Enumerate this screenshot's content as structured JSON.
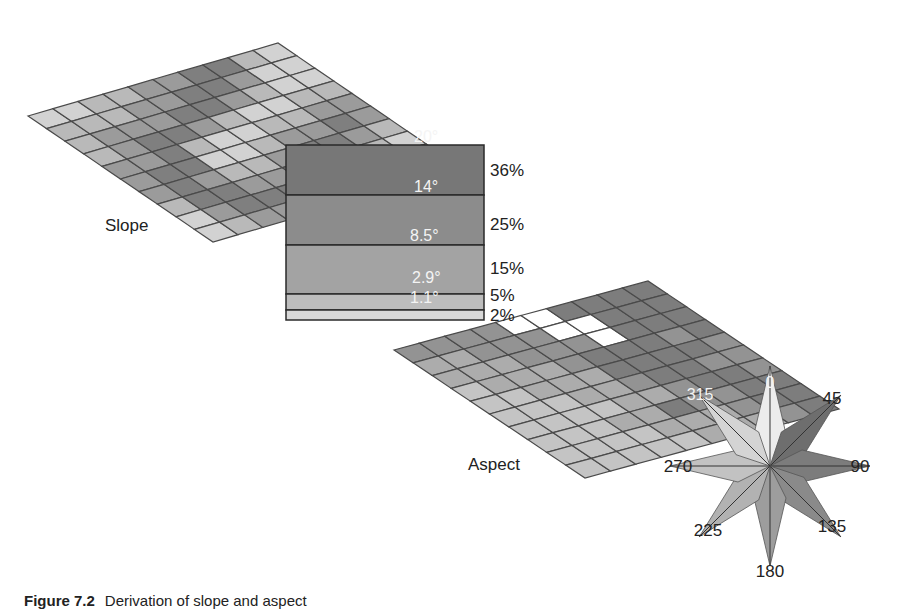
{
  "slope": {
    "label": "Slope",
    "grid_size": 10,
    "cells": [
      [
        4,
        4,
        3,
        3,
        2,
        2,
        1,
        1,
        3,
        4
      ],
      [
        3,
        3,
        3,
        2,
        2,
        1,
        1,
        2,
        4,
        4
      ],
      [
        3,
        2,
        2,
        2,
        1,
        1,
        2,
        3,
        4,
        4
      ],
      [
        3,
        2,
        1,
        1,
        2,
        3,
        4,
        4,
        3,
        3
      ],
      [
        2,
        2,
        1,
        3,
        4,
        4,
        3,
        3,
        2,
        2
      ],
      [
        2,
        1,
        1,
        4,
        4,
        3,
        2,
        2,
        1,
        2
      ],
      [
        2,
        1,
        2,
        3,
        3,
        2,
        1,
        1,
        2,
        3
      ],
      [
        3,
        1,
        1,
        2,
        2,
        1,
        1,
        2,
        3,
        4
      ],
      [
        4,
        2,
        1,
        1,
        1,
        2,
        3,
        4,
        4,
        3
      ],
      [
        4,
        3,
        2,
        2,
        3,
        3,
        4,
        4,
        3,
        3
      ]
    ]
  },
  "legend": {
    "bands": [
      {
        "degrees": "20°",
        "percent": "36%",
        "color": "#777777"
      },
      {
        "degrees": "14°",
        "percent": "25%",
        "color": "#8c8c8c"
      },
      {
        "degrees": "8.5°",
        "percent": "15%",
        "color": "#a3a3a3"
      },
      {
        "degrees": "2.9°",
        "percent": "5%",
        "color": "#bdbdbd"
      },
      {
        "degrees": "1.1°",
        "percent": "2%",
        "color": "#d8d8d8"
      }
    ]
  },
  "aspect": {
    "label": "Aspect",
    "grid_size": 10,
    "cells": [
      [
        2,
        2,
        2,
        2,
        0,
        0,
        1,
        1,
        1,
        1
      ],
      [
        3,
        3,
        2,
        2,
        2,
        0,
        0,
        1,
        1,
        1
      ],
      [
        3,
        3,
        3,
        2,
        2,
        2,
        0,
        1,
        1,
        1
      ],
      [
        4,
        3,
        3,
        3,
        2,
        1,
        1,
        1,
        2,
        1
      ],
      [
        4,
        4,
        3,
        3,
        3,
        1,
        1,
        1,
        1,
        2
      ],
      [
        4,
        4,
        4,
        3,
        3,
        2,
        1,
        1,
        2,
        2
      ],
      [
        4,
        4,
        4,
        4,
        3,
        3,
        2,
        1,
        1,
        2
      ],
      [
        4,
        4,
        4,
        3,
        3,
        1,
        2,
        2,
        1,
        1
      ],
      [
        4,
        4,
        4,
        4,
        3,
        3,
        3,
        2,
        1,
        1
      ],
      [
        4,
        4,
        4,
        4,
        4,
        3,
        3,
        3,
        2,
        1
      ]
    ],
    "colors": [
      "#ffffff",
      "#7d7d7d",
      "#939393",
      "#acacac",
      "#c4c4c4"
    ]
  },
  "compass": {
    "directions": [
      {
        "label": "0",
        "angle": 0,
        "color": "#ececec"
      },
      {
        "label": "45",
        "angle": 45,
        "color": "#6e6e6e"
      },
      {
        "label": "90",
        "angle": 90,
        "color": "#7c7c7c"
      },
      {
        "label": "135",
        "angle": 135,
        "color": "#8a8a8a"
      },
      {
        "label": "180",
        "angle": 180,
        "color": "#9d9d9d"
      },
      {
        "label": "225",
        "angle": 225,
        "color": "#b2b2b2"
      },
      {
        "label": "270",
        "angle": 270,
        "color": "#c2c2c2"
      },
      {
        "label": "315",
        "angle": 315,
        "color": "#d4d4d4"
      }
    ]
  },
  "caption": {
    "figure": "Figure 7.2",
    "text": "Derivation of slope and aspect"
  }
}
